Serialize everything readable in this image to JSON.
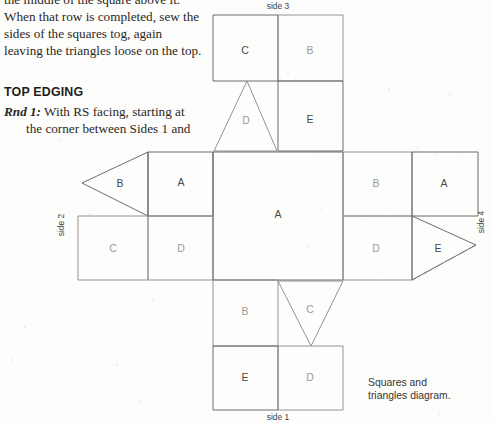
{
  "page": {
    "width": 492,
    "height": 422,
    "background": "#fdfdfc",
    "ink": "#2b2724",
    "rule_color": "#5e5c5a"
  },
  "body_text": {
    "intro_paragraph": "the middle of the square above it. When that row is completed, sew the sides of the squares tog, again leaving the triangles loose on the top.",
    "heading": "TOP EDGING",
    "rnd_label": "Rnd 1:",
    "rnd_line1": " With RS facing, starting at",
    "rnd_line2": "the corner between Sides 1 and"
  },
  "diagram": {
    "caption_line1": "Squares and",
    "caption_line2": "triangles diagram.",
    "side_labels": [
      {
        "name": "side-label-top",
        "text": "side 3",
        "x": 278,
        "y": 9,
        "rotate": 0
      },
      {
        "name": "side-label-bottom",
        "text": "side 1",
        "x": 278,
        "y": 420,
        "rotate": 0
      },
      {
        "name": "side-label-left",
        "text": "side 2",
        "x": 64,
        "y": 225,
        "rotate": -90
      },
      {
        "name": "side-label-right",
        "text": "side 4",
        "x": 484,
        "y": 222,
        "rotate": -90
      }
    ],
    "shapes": [
      {
        "name": "square-top-C",
        "kind": "square",
        "label": "C",
        "faint": false,
        "points": "213,15 278,15 278,81 213,81",
        "lx": 245,
        "ly": 51
      },
      {
        "name": "square-top-B",
        "kind": "square",
        "label": "B",
        "faint": true,
        "points": "278,15 343,15 343,81 278,81",
        "lx": 310,
        "ly": 51
      },
      {
        "name": "triangle-upper-D",
        "kind": "triangle",
        "label": "D",
        "faint": true,
        "points": "247,81 277,151 214,151",
        "lx": 246,
        "ly": 121
      },
      {
        "name": "square-upper-E",
        "kind": "square",
        "label": "E",
        "faint": false,
        "points": "278,81 343,81 343,151 278,151",
        "lx": 310,
        "ly": 120
      },
      {
        "name": "triangle-left-B",
        "kind": "triangle",
        "label": "B",
        "faint": false,
        "points": "82,183 148,152 148,216",
        "lx": 120,
        "ly": 184
      },
      {
        "name": "square-left-A",
        "kind": "square",
        "label": "A",
        "faint": false,
        "points": "148,152 213,152 213,216 148,216",
        "lx": 181,
        "ly": 183
      },
      {
        "name": "square-left-C",
        "kind": "square",
        "label": "C",
        "faint": true,
        "points": "78,216 148,216 148,280 78,280",
        "lx": 113,
        "ly": 249
      },
      {
        "name": "square-left-D",
        "kind": "square",
        "label": "D",
        "faint": true,
        "points": "148,216 213,216 213,280 148,280",
        "lx": 181,
        "ly": 249
      },
      {
        "name": "square-center-A",
        "kind": "square",
        "label": "A",
        "faint": false,
        "points": "213,152 343,152 343,280 213,280",
        "lx": 278,
        "ly": 215
      },
      {
        "name": "square-right-B",
        "kind": "square",
        "label": "B",
        "faint": true,
        "points": "343,152 412,152 412,216 343,216",
        "lx": 376,
        "ly": 184
      },
      {
        "name": "square-right-A",
        "kind": "square",
        "label": "A",
        "faint": false,
        "points": "412,152 478,152 478,216 412,216",
        "lx": 444,
        "ly": 184
      },
      {
        "name": "square-right-D",
        "kind": "square",
        "label": "D",
        "faint": true,
        "points": "343,216 412,216 412,280 343,280",
        "lx": 376,
        "ly": 249
      },
      {
        "name": "triangle-right-E",
        "kind": "triangle",
        "label": "E",
        "faint": false,
        "points": "412,216 476,245 412,280",
        "lx": 438,
        "ly": 249
      },
      {
        "name": "square-lower-B",
        "kind": "square",
        "label": "B",
        "faint": true,
        "points": "213,280 278,280 278,346 213,346",
        "lx": 245,
        "ly": 312
      },
      {
        "name": "triangle-lower-C",
        "kind": "triangle",
        "label": "C",
        "faint": true,
        "points": "278,281 343,281 311,346",
        "lx": 310,
        "ly": 310
      },
      {
        "name": "square-bottom-E",
        "kind": "square",
        "label": "E",
        "faint": false,
        "points": "213,346 278,346 278,410 213,410",
        "lx": 245,
        "ly": 378
      },
      {
        "name": "square-bottom-D",
        "kind": "square",
        "label": "D",
        "faint": true,
        "points": "278,346 343,346 343,410 278,410",
        "lx": 310,
        "ly": 378
      }
    ],
    "extra_strokes": [
      {
        "name": "stroke-dashed-E-lower",
        "d": "M 412,280 L 476,245",
        "style": "dashy"
      }
    ]
  }
}
